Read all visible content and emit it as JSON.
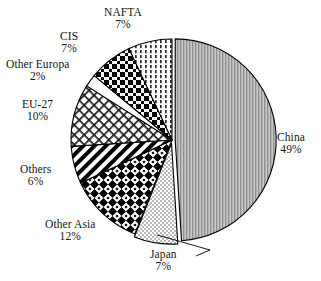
{
  "chart_data": {
    "type": "pie",
    "title": "",
    "subtitle": "",
    "xlabel": "",
    "ylabel": "",
    "legend_position": "none",
    "grid": false,
    "units": "percent",
    "start_angle_deg": 0,
    "direction": "clockwise",
    "categories": [
      "China",
      "Japan",
      "Other Asia",
      "Others",
      "EU-27",
      "Other Europa",
      "CIS",
      "NAFTA"
    ],
    "values": [
      49,
      7,
      12,
      6,
      10,
      2,
      7,
      7
    ],
    "slices": [
      {
        "id": "china",
        "label": "China",
        "value_label": "49%",
        "value": 49,
        "pattern": "fine-gray-stipple",
        "exploded": true,
        "label_x": 277,
        "label_y": 131,
        "label_align": "left",
        "leader": false
      },
      {
        "id": "japan",
        "label": "Japan",
        "value_label": "7%",
        "value": 7,
        "pattern": "light-dot-grid",
        "exploded": true,
        "label_x": 150,
        "label_y": 248,
        "label_align": "center",
        "leader": true
      },
      {
        "id": "other-asia",
        "label": "Other Asia",
        "value_label": "12%",
        "value": 12,
        "pattern": "bold-diamond-checker",
        "exploded": false,
        "label_x": 45,
        "label_y": 218,
        "label_align": "center",
        "leader": false
      },
      {
        "id": "others",
        "label": "Others",
        "value_label": "6%",
        "value": 6,
        "pattern": "bold-diagonal-stripes",
        "exploded": false,
        "label_x": 20,
        "label_y": 163,
        "label_align": "center",
        "leader": false
      },
      {
        "id": "eu-27",
        "label": "EU-27",
        "value_label": "10%",
        "value": 10,
        "pattern": "fine-diagonal-crosshatch",
        "exploded": false,
        "label_x": 22,
        "label_y": 98,
        "label_align": "center",
        "leader": false
      },
      {
        "id": "other-europa",
        "label": "Other Europa",
        "value_label": "2%",
        "value": 2,
        "pattern": "white-blank",
        "exploded": false,
        "label_x": 6,
        "label_y": 58,
        "label_align": "center",
        "leader": false
      },
      {
        "id": "cis",
        "label": "CIS",
        "value_label": "7%",
        "value": 7,
        "pattern": "dark-checker",
        "exploded": false,
        "label_x": 60,
        "label_y": 30,
        "label_align": "center",
        "leader": false
      },
      {
        "id": "nafta",
        "label": "NAFTA",
        "value_label": "7%",
        "value": 7,
        "pattern": "vertical-dotted-lines",
        "exploded": false,
        "label_x": 104,
        "label_y": 6,
        "label_align": "center",
        "leader": false
      }
    ],
    "colors": {
      "outline": "#000000",
      "background": "#ffffff",
      "china_fill": "#a8a8a8",
      "ink": "#000000"
    },
    "geometry": {
      "center_x": 172,
      "center_y": 140,
      "radius": 101
    }
  }
}
